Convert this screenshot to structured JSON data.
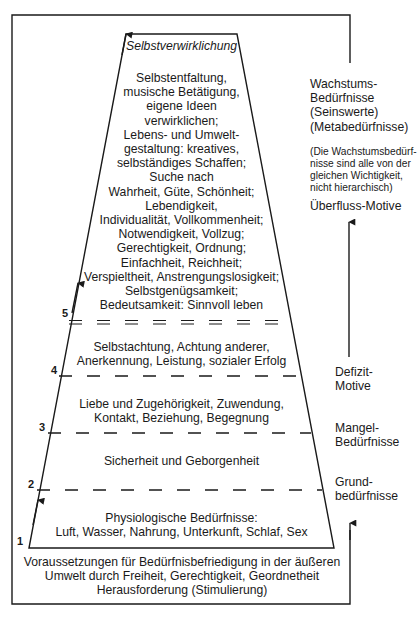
{
  "pyramid": {
    "apex_label": "Selbstverwirklichung",
    "levels": [
      {
        "number": "5",
        "lines": [
          "Selbstentfaltung,",
          "musische Betätigung,",
          "eigene Ideen",
          "verwirklichen;",
          "Lebens- und Umwelt-",
          "gestaltung: kreatives,",
          "selbständiges Schaffen;",
          "Suche nach",
          "Wahrheit, Güte, Schönheit;",
          "Lebendigkeit,",
          "Individualität, Vollkommenheit;",
          "Notwendigkeit, Vollzug;",
          "Gerechtigkeit, Ordnung;",
          "Einfachheit, Reichheit;",
          "Verspieltheit, Anstrengungslosigkeit;",
          "Selbstgenügsamkeit;",
          "Bedeutsamkeit: Sinnvoll leben"
        ]
      },
      {
        "number": "4",
        "lines": [
          "Selbstachtung, Achtung anderer,",
          "Anerkennung, Leistung, sozialer Erfolg"
        ]
      },
      {
        "number": "3",
        "lines": [
          "Liebe und Zugehörigkeit, Zuwendung,",
          "Kontakt, Beziehung, Begegnung"
        ]
      },
      {
        "number": "2",
        "lines": [
          "Sicherheit und Geborgenheit"
        ]
      },
      {
        "number": "1",
        "lines": [
          "Physiologische Bedürfnisse:",
          "Luft, Wasser, Nahrung, Unterkunft, Schlaf, Sex"
        ]
      }
    ],
    "base_lines": [
      "Voraussetzungen für Bedürfnisbefriedigung in der äußeren",
      "Umwelt durch Freiheit, Gerechtigkeit, Geordnetheit",
      "Herausforderung (Stimulierung)"
    ]
  },
  "side_labels": {
    "growth": [
      "Wachstums-",
      "Bedürfnisse",
      "(Seinswerte)",
      "(Metabedürfnisse)"
    ],
    "growth_note": [
      "(Die Wachstumsbedürf-",
      "nisse sind alle von der",
      "gleichen Wichtigkeit,",
      "nicht hierarchisch)"
    ],
    "surplus": "Überfluss-Motive",
    "deficit": [
      "Defizit-",
      "Motive"
    ],
    "lack": [
      "Mangel-",
      "Bedürfnisse"
    ],
    "basic": [
      "Grund-",
      "bedürfnisse"
    ]
  },
  "colors": {
    "ink": "#1a1a1a",
    "background": "#ffffff"
  }
}
